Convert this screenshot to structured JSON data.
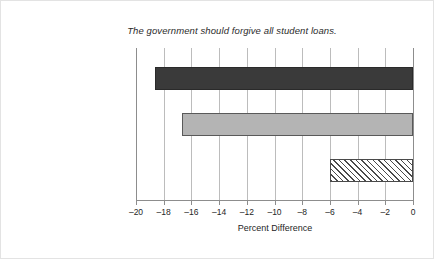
{
  "chart_data": {
    "type": "bar",
    "orientation": "horizontal",
    "title": "The government should forgive all student loans.",
    "xlabel": "Percent Difference",
    "ylabel": "",
    "categories": [
      "White (n = 760)",
      "Latino (n = 256)",
      "African American (n = 190)"
    ],
    "values": [
      -18.6,
      -16.7,
      -6.0
    ],
    "xlim": [
      -20,
      0
    ],
    "xticks": [
      -20,
      -18,
      -16,
      -14,
      -12,
      -10,
      -8,
      -6,
      -4,
      -2,
      0
    ],
    "xtick_labels": [
      "–20",
      "–18",
      "–16",
      "–14",
      "–12",
      "–10",
      "–8",
      "–6",
      "–4",
      "–2",
      "0"
    ],
    "grid": "vertical",
    "legend": "none",
    "bar_styles": [
      "solid-dark",
      "solid-gray",
      "diagonal-hatch"
    ],
    "colors": {
      "bar_white": "#3a3a3a",
      "bar_latino": "#b4b4b4",
      "bar_african_american": "#ffffff",
      "hatch": "#4a4a4a",
      "gridline": "#bcbcbc",
      "axis": "#8d8d8d",
      "text": "#262626",
      "background": "#ffffff"
    }
  }
}
